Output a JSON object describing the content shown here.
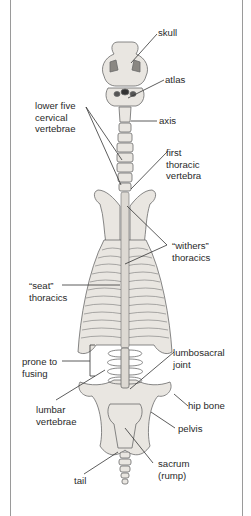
{
  "diagram": {
    "labels": {
      "skull": "skull",
      "atlas": "atlas",
      "axis": "axis",
      "lower_cervical": "lower five\ncervical\nvertebrae",
      "first_thoracic": "first\nthoracic\nvertebra",
      "withers": "“withers”\nthoracics",
      "seat": "“seat”\nthoracics",
      "prone": "prone to\nfusing",
      "lumbosacral": "lumbosacral\njoint",
      "lumbar": "lumbar\nvertebrae",
      "hip": "hip bone",
      "pelvis": "pelvis",
      "sacrum": "sacrum\n(rump)",
      "tail": "tail"
    },
    "colors": {
      "bone_fill": "#e9e6e1",
      "bone_stroke": "#6a6a6a",
      "leader_line": "#333333",
      "frame": "#9a9a9a",
      "text": "#2a2a2a"
    }
  }
}
